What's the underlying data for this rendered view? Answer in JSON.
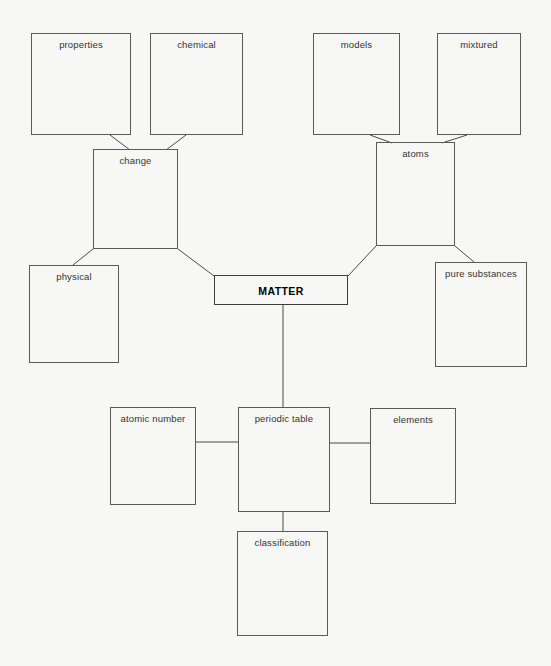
{
  "diagram": {
    "background_color": "#f7f7f6",
    "box_border_color": "#5a5a5a",
    "edge_color": "#4a4a4a",
    "text_color": "#343434",
    "nodes": [
      {
        "id": "properties",
        "label": "properties",
        "x": 31,
        "y": 33,
        "w": 100,
        "h": 102,
        "root": false
      },
      {
        "id": "chemical",
        "label": "chemical",
        "x": 150,
        "y": 33,
        "w": 93,
        "h": 102,
        "root": false
      },
      {
        "id": "models",
        "label": "models",
        "x": 313,
        "y": 33,
        "w": 87,
        "h": 102,
        "root": false
      },
      {
        "id": "mixtured",
        "label": "mixtured",
        "x": 437,
        "y": 33,
        "w": 84,
        "h": 102,
        "root": false
      },
      {
        "id": "change",
        "label": "change",
        "x": 93,
        "y": 149,
        "w": 85,
        "h": 100,
        "root": false
      },
      {
        "id": "atoms",
        "label": "atoms",
        "x": 376,
        "y": 142,
        "w": 79,
        "h": 104,
        "root": false
      },
      {
        "id": "physical",
        "label": "physical",
        "x": 29,
        "y": 265,
        "w": 90,
        "h": 98,
        "root": false
      },
      {
        "id": "matter",
        "label": "MATTER",
        "x": 214,
        "y": 275,
        "w": 134,
        "h": 30,
        "root": true
      },
      {
        "id": "pure-substances",
        "label": "pure substances",
        "x": 435,
        "y": 262,
        "w": 92,
        "h": 105,
        "root": false
      },
      {
        "id": "atomic-number",
        "label": "atomic number",
        "x": 110,
        "y": 407,
        "w": 86,
        "h": 98,
        "root": false
      },
      {
        "id": "periodic-table",
        "label": "periodic table",
        "x": 238,
        "y": 407,
        "w": 92,
        "h": 105,
        "root": false
      },
      {
        "id": "elements",
        "label": "elements",
        "x": 370,
        "y": 408,
        "w": 86,
        "h": 96,
        "root": false
      },
      {
        "id": "classification",
        "label": "classification",
        "x": 237,
        "y": 531,
        "w": 91,
        "h": 105,
        "root": false
      }
    ],
    "edges": [
      {
        "from": "properties",
        "to": "change",
        "points": "110,135 130,150"
      },
      {
        "from": "chemical",
        "to": "change",
        "points": "186,135 166,150"
      },
      {
        "from": "models",
        "to": "atoms",
        "points": "370,135 392,143"
      },
      {
        "from": "mixtured",
        "to": "atoms",
        "points": "467,135 442,143"
      },
      {
        "from": "change",
        "to": "physical",
        "points": "93,249 73,265"
      },
      {
        "from": "change",
        "to": "matter",
        "points": "178,249 214,276"
      },
      {
        "from": "atoms",
        "to": "matter",
        "points": "376,246 348,276"
      },
      {
        "from": "atoms",
        "to": "pure-substances",
        "points": "455,246 474,262"
      },
      {
        "from": "matter",
        "to": "periodic-table",
        "points": "283,305 283,407"
      },
      {
        "from": "atomic-number",
        "to": "periodic-table",
        "points": "196,442 238,442"
      },
      {
        "from": "periodic-table",
        "to": "elements",
        "points": "330,443 370,443"
      },
      {
        "from": "periodic-table",
        "to": "classification",
        "points": "283,512 283,531"
      }
    ]
  }
}
